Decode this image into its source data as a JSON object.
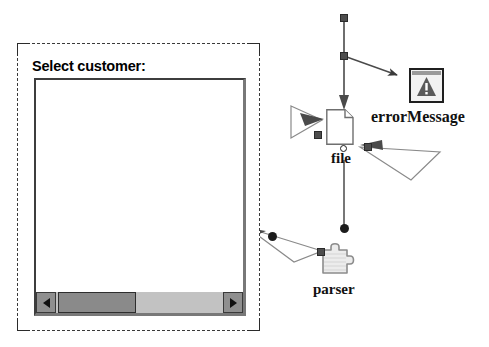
{
  "canvas": {
    "width": 489,
    "height": 347,
    "background": "#ffffff"
  },
  "dialog": {
    "title": "Select customer:",
    "selected": true,
    "list": {
      "items": [],
      "empty": true
    },
    "scrollbar": {
      "orientation": "horizontal",
      "left_arrow": "◀",
      "right_arrow": "▶",
      "thumb_position_percent": 2,
      "thumb_width_percent": 45
    }
  },
  "diagram": {
    "nodes": [
      {
        "id": "errorMessage",
        "label": "errorMessage",
        "icon": "warning-triangle-icon"
      },
      {
        "id": "file",
        "label": "file",
        "icon": "document-page-icon"
      },
      {
        "id": "parser",
        "label": "parser",
        "icon": "puzzle-component-icon"
      }
    ],
    "connectors": [
      {
        "id": "trace-top-vertical",
        "from": "top-anchor",
        "to": "file",
        "style": "solid-arrow"
      },
      {
        "id": "trace-to-errormessage",
        "from": "mid-anchor",
        "to": "errorMessage",
        "style": "solid-arrow"
      },
      {
        "id": "trace-left-wedge",
        "from": "left-handle",
        "to": "file",
        "style": "wedge-arrow"
      },
      {
        "id": "trace-right-wedge",
        "from": "right-handle",
        "to": "file",
        "style": "wedge-arrow"
      },
      {
        "id": "trace-file-to-parser",
        "from": "file",
        "to": "parser",
        "style": "solid-line-dot"
      },
      {
        "id": "trace-parser-to-dialog",
        "from": "parser",
        "to": "dialog",
        "style": "wedge-arrow"
      }
    ],
    "handles": [
      {
        "id": "handle-top",
        "x": 340,
        "y": 14,
        "shape": "square"
      },
      {
        "id": "handle-mid",
        "x": 340,
        "y": 52,
        "shape": "square"
      },
      {
        "id": "handle-left-wedge",
        "x": 314,
        "y": 131,
        "shape": "square"
      },
      {
        "id": "handle-right-wedge",
        "x": 364,
        "y": 143,
        "shape": "square"
      },
      {
        "id": "handle-file-bottom",
        "x": 337,
        "y": 149,
        "shape": "ring"
      },
      {
        "id": "handle-link-dot",
        "x": 340,
        "y": 226,
        "shape": "dot"
      },
      {
        "id": "handle-parser-link",
        "x": 314,
        "y": 250,
        "shape": "square"
      },
      {
        "id": "handle-bend-dot",
        "x": 272,
        "y": 235,
        "shape": "dot"
      }
    ]
  }
}
